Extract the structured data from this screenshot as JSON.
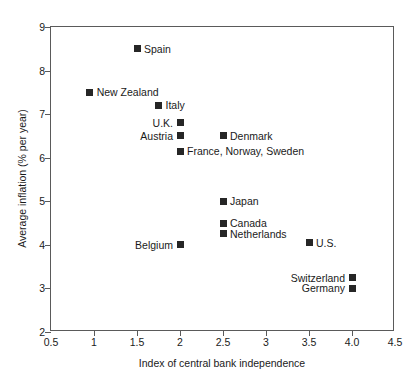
{
  "chart_data": {
    "type": "scatter",
    "title": "",
    "xlabel": "Index of central bank independence",
    "ylabel": "Average inflation (% per year)",
    "xlim": [
      0.5,
      4.5
    ],
    "ylim": [
      2,
      9
    ],
    "grid": false,
    "legend": "none",
    "xticks": [
      "0.5",
      "1",
      "1.5",
      "2",
      "2.5",
      "3",
      "3.5",
      "4.0",
      "4.5"
    ],
    "xtick_values": [
      0.5,
      1,
      1.5,
      2,
      2.5,
      3,
      3.5,
      4.0,
      4.5
    ],
    "yticks": [
      "2",
      "3",
      "4",
      "5",
      "6",
      "7",
      "8",
      "9"
    ],
    "ytick_values": [
      2,
      3,
      4,
      5,
      6,
      7,
      8,
      9
    ],
    "marker_color": "#262626",
    "axis_color": "#5a5a5a",
    "points": [
      {
        "label": "Spain",
        "x": 1.5,
        "y": 8.5,
        "label_side": "right"
      },
      {
        "label": "New Zealand",
        "x": 0.95,
        "y": 7.5,
        "label_side": "right"
      },
      {
        "label": "Italy",
        "x": 1.75,
        "y": 7.2,
        "label_side": "right"
      },
      {
        "label": "U.K.",
        "x": 2.0,
        "y": 6.8,
        "label_side": "left"
      },
      {
        "label": "Austria",
        "x": 2.0,
        "y": 6.5,
        "label_side": "left"
      },
      {
        "label": "Denmark",
        "x": 2.5,
        "y": 6.5,
        "label_side": "right"
      },
      {
        "label": "France, Norway, Sweden",
        "x": 2.0,
        "y": 6.15,
        "label_side": "right"
      },
      {
        "label": "Japan",
        "x": 2.5,
        "y": 5.0,
        "label_side": "right"
      },
      {
        "label": "Canada",
        "x": 2.5,
        "y": 4.5,
        "label_side": "right"
      },
      {
        "label": "Netherlands",
        "x": 2.5,
        "y": 4.25,
        "label_side": "right"
      },
      {
        "label": "Belgium",
        "x": 2.0,
        "y": 4.0,
        "label_side": "left"
      },
      {
        "label": "U.S.",
        "x": 3.5,
        "y": 4.05,
        "label_side": "right"
      },
      {
        "label": "Switzerland",
        "x": 4.0,
        "y": 3.25,
        "label_side": "left"
      },
      {
        "label": "Germany",
        "x": 4.0,
        "y": 3.0,
        "label_side": "left"
      }
    ]
  }
}
